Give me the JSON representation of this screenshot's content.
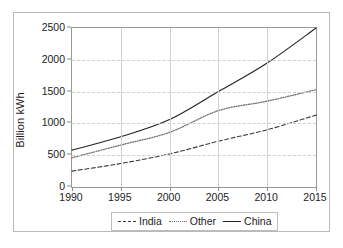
{
  "chart_data": {
    "type": "line",
    "title": "",
    "xlabel": "",
    "ylabel": "Billion kWh",
    "xlim": [
      1990,
      2015
    ],
    "ylim": [
      0,
      2500
    ],
    "xticks": [
      1990,
      1995,
      2000,
      2005,
      2010,
      2015
    ],
    "yticks": [
      0,
      500,
      1000,
      1500,
      2000,
      2500
    ],
    "grid": true,
    "legend_position": "bottom-center",
    "x": [
      1990,
      1995,
      2000,
      2005,
      2010,
      2015
    ],
    "series": [
      {
        "name": "India",
        "style": "dashed",
        "color": "#3a3a3a",
        "values": [
          250,
          370,
          520,
          720,
          900,
          1130
        ]
      },
      {
        "name": "Other",
        "style": "dotted",
        "color": "#6f6f6f",
        "values": [
          460,
          660,
          860,
          1200,
          1350,
          1530
        ]
      },
      {
        "name": "China",
        "style": "solid",
        "color": "#222222",
        "values": [
          580,
          790,
          1060,
          1500,
          1950,
          2500
        ]
      }
    ]
  },
  "legend": {
    "items": [
      {
        "label": "India",
        "style": "dashed"
      },
      {
        "label": "Other",
        "style": "dotted"
      },
      {
        "label": "China",
        "style": "solid"
      }
    ]
  },
  "colors": {
    "frame": "#9a9a9a",
    "outer_border": "#b9b9b9",
    "grid": "#cfcfcf",
    "text": "#1c1c1c",
    "background": "#ffffff"
  }
}
